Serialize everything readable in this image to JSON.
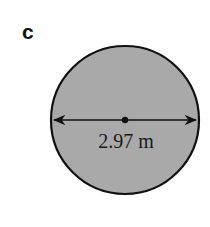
{
  "figure": {
    "part_label": "c",
    "shape": "circle",
    "measurement": {
      "type": "diameter",
      "label": "2.97 m",
      "value": 2.97,
      "unit": "m"
    },
    "colors": {
      "fill": "#a9a9a9",
      "stroke": "#111111",
      "background": "#ffffff"
    }
  }
}
